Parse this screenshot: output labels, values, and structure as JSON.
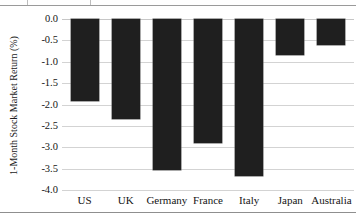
{
  "chart_data": {
    "type": "bar",
    "title": "",
    "subtitle": "",
    "xlabel": "",
    "ylabel": "1-Month Stock Market Return (%)",
    "categories": [
      "US",
      "UK",
      "Germany",
      "France",
      "Italy",
      "Japan",
      "Australia"
    ],
    "values": [
      -1.92,
      -2.35,
      -3.53,
      -2.9,
      -3.68,
      -0.84,
      -0.61
    ],
    "series": [
      {
        "name": "1-Month Stock Market Return (%)",
        "values": [
          -1.92,
          -2.35,
          -3.53,
          -2.9,
          -3.68,
          -0.84,
          -0.61
        ]
      }
    ],
    "ylim": [
      -4.0,
      0.0
    ],
    "ytick_labels": [
      "0.0",
      "-0.5",
      "-1.0",
      "-1.5",
      "-2.0",
      "-2.5",
      "-3.0",
      "-3.5",
      "-4.0"
    ],
    "ytick_values": [
      0.0,
      -0.5,
      -1.0,
      -1.5,
      -2.0,
      -2.5,
      -3.0,
      -3.5,
      -4.0
    ],
    "grid": true,
    "grid_axis": "y",
    "legend": false,
    "legend_position": "none",
    "bar_color": "#1f1f1f",
    "gridline_color": "#d3d3d3",
    "background_color": "#ffffff",
    "text_color": "#141414"
  }
}
